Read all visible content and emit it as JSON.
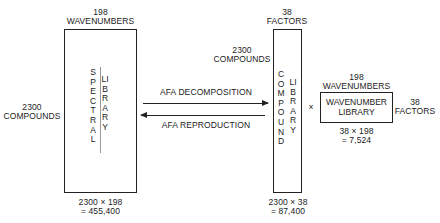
{
  "spectral_library": {
    "top_label_count": "198",
    "top_label_unit": "WAVENUMBERS",
    "left_label_count": "2300",
    "left_label_unit": "COMPOUNDS",
    "title_word1": "SPECTRAL",
    "title_word2": "LIBRARY",
    "size_formula": "2300 × 198",
    "size_result": "= 455,400"
  },
  "arrows": {
    "forward_label": "AFA DECOMPOSITION",
    "backward_label": "AFA REPRODUCTION"
  },
  "compound_library": {
    "top_label_count": "38",
    "top_label_unit": "FACTORS",
    "left_label_count": "2300",
    "left_label_unit": "COMPOUNDS",
    "title_word1": "COMPOUND",
    "title_word2": "LIBRARY",
    "size_formula": "2300 × 38",
    "size_result": "= 87,400"
  },
  "operator": "×",
  "wavenumber_library": {
    "top_label_count": "198",
    "top_label_unit": "WAVENUMBERS",
    "right_label_count": "38",
    "right_label_unit": "FACTORS",
    "title_line1": "WAVENUMBER",
    "title_line2": "LIBRARY",
    "size_formula": "38 × 198",
    "size_result": "= 7,524"
  }
}
